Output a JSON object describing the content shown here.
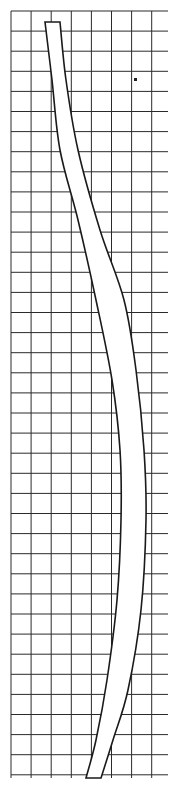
{
  "diagram": {
    "type": "grid-drawing",
    "grid": {
      "left": 11,
      "top": 11,
      "right": 168,
      "bottom": 778,
      "cell": 20.1,
      "line_color": "#2a2a2a"
    },
    "strip": {
      "fill": "#ffffff",
      "stroke": "#1a1a1a",
      "left_edge": [
        [
          45,
          22
        ],
        [
          52,
          80
        ],
        [
          60,
          150
        ],
        [
          78,
          220
        ],
        [
          96,
          300
        ],
        [
          112,
          380
        ],
        [
          120,
          450
        ],
        [
          121,
          520
        ],
        [
          117,
          600
        ],
        [
          107,
          680
        ],
        [
          96,
          740
        ],
        [
          86,
          778
        ]
      ],
      "right_edge": [
        [
          60,
          22
        ],
        [
          66,
          80
        ],
        [
          78,
          150
        ],
        [
          100,
          230
        ],
        [
          124,
          300
        ],
        [
          136,
          370
        ],
        [
          144,
          450
        ],
        [
          146,
          520
        ],
        [
          141,
          610
        ],
        [
          128,
          690
        ],
        [
          113,
          740
        ],
        [
          101,
          778
        ]
      ]
    },
    "dot": {
      "x": 134,
      "y": 78
    }
  }
}
